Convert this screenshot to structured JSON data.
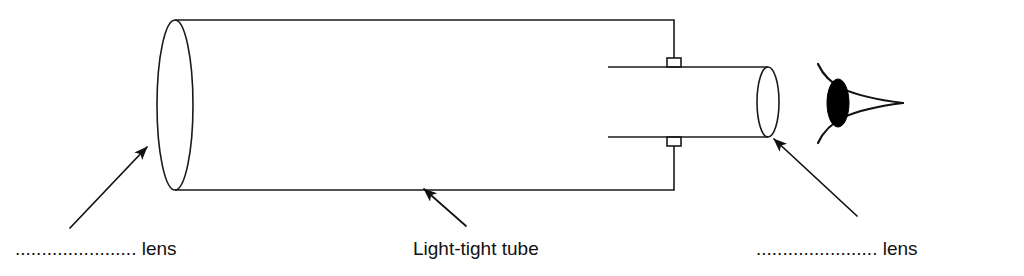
{
  "figure": {
    "background_color": "#ffffff",
    "line_color": "#1a1a1a",
    "text_color": "#111111",
    "width": 1024,
    "height": 276
  },
  "labels": {
    "objective_lens": {
      "leader_dots": ".......................",
      "text": "lens",
      "full_text": "....................... lens",
      "x": 15,
      "y": 255
    },
    "tube": {
      "text": "Light-tight tube",
      "x": 413,
      "y": 255
    },
    "eyepiece_lens": {
      "leader_dots": ".......................",
      "text": "lens",
      "full_text": "....................... lens",
      "x": 756,
      "y": 255
    }
  },
  "parts": {
    "objective_lens_ellipse": {
      "name": "objective lens",
      "cx": 175,
      "cy": 105,
      "rx": 18,
      "ry": 85
    },
    "main_tube": {
      "name": "light-tight tube body",
      "left": 175,
      "right": 675,
      "top": 20,
      "bottom": 190
    },
    "eyepiece_tube": {
      "name": "eyepiece draw tube",
      "left": 608,
      "right": 768,
      "top": 67,
      "bottom": 137
    },
    "eyepiece_lens_ellipse": {
      "name": "eyepiece lens",
      "cx": 768,
      "cy": 102,
      "rx": 11,
      "ry": 35
    },
    "bracket_top": {
      "name": "top mounting bracket",
      "x": 667,
      "y": 58,
      "w": 14,
      "h": 9
    },
    "bracket_bottom": {
      "name": "bottom mounting bracket",
      "x": 667,
      "y": 137,
      "w": 14,
      "h": 9
    },
    "eye": {
      "name": "observer eye",
      "pupil_cx": 838,
      "pupil_cy": 103,
      "pupil_rx": 11,
      "pupil_ry": 24,
      "apex_x": 903,
      "apex_y": 103
    }
  },
  "arrows": [
    {
      "name": "objective-lens-arrow",
      "x1": 70,
      "y1": 228,
      "x2": 147,
      "y2": 147
    },
    {
      "name": "tube-arrow",
      "x1": 466,
      "y1": 226,
      "x2": 424,
      "y2": 189
    },
    {
      "name": "eyepiece-lens-arrow",
      "x1": 857,
      "y1": 216,
      "x2": 774,
      "y2": 139
    }
  ]
}
